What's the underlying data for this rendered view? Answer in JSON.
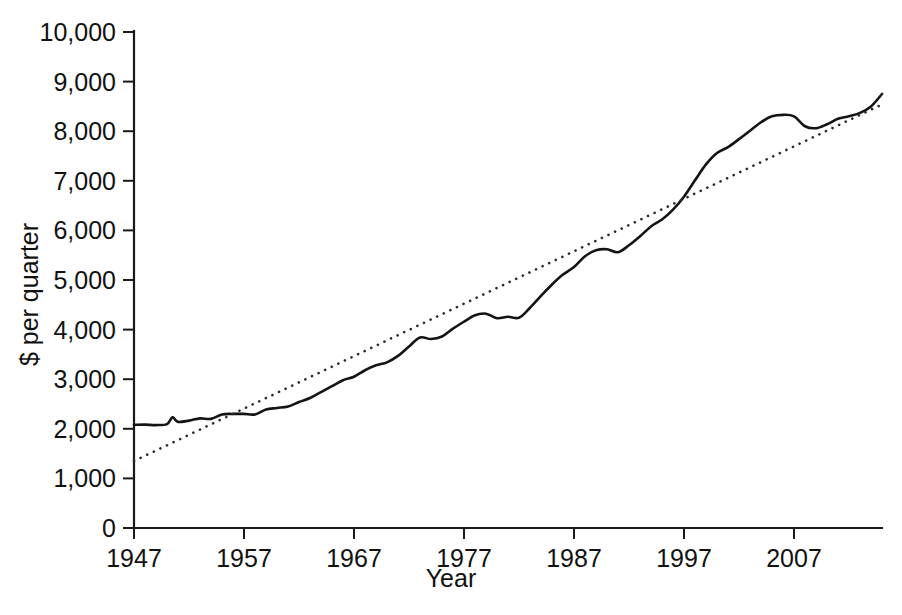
{
  "chart_data": {
    "type": "line",
    "title": "",
    "xlabel": "Year",
    "ylabel": "$ per quarter",
    "xlim": [
      1947,
      2015
    ],
    "ylim": [
      0,
      10000
    ],
    "grid": false,
    "legend": "none",
    "x_ticks": [
      "1947",
      "1957",
      "1967",
      "1977",
      "1987",
      "1997",
      "2007"
    ],
    "x_tick_values": [
      1947,
      1957,
      1967,
      1977,
      1987,
      1997,
      2007
    ],
    "y_ticks": [
      "0",
      "1,000",
      "2,000",
      "3,000",
      "4,000",
      "5,000",
      "6,000",
      "7,000",
      "8,000",
      "9,000",
      "10,000"
    ],
    "y_tick_values": [
      0,
      1000,
      2000,
      3000,
      4000,
      5000,
      6000,
      7000,
      8000,
      9000,
      10000
    ],
    "series": [
      {
        "name": "Consumption per quarter",
        "style": "solid",
        "color": "#141414",
        "x": [
          1947,
          1948,
          1949,
          1950,
          1950.5,
          1951,
          1952,
          1953,
          1954,
          1955,
          1956,
          1957,
          1958,
          1959,
          1960,
          1961,
          1962,
          1963,
          1964,
          1965,
          1966,
          1967,
          1968,
          1969,
          1970,
          1971,
          1972,
          1973,
          1974,
          1975,
          1976,
          1977,
          1978,
          1979,
          1980,
          1981,
          1982,
          1983,
          1984,
          1985,
          1986,
          1987,
          1988,
          1989,
          1990,
          1991,
          1992,
          1993,
          1994,
          1995,
          1996,
          1997,
          1998,
          1999,
          2000,
          2001,
          2002,
          2003,
          2004,
          2005,
          2006,
          2007,
          2008,
          2009,
          2010,
          2011,
          2012,
          2013,
          2014,
          2015
        ],
        "y": [
          2080,
          2085,
          2075,
          2095,
          2230,
          2140,
          2165,
          2210,
          2200,
          2290,
          2300,
          2300,
          2290,
          2390,
          2420,
          2450,
          2540,
          2620,
          2740,
          2860,
          2980,
          3050,
          3180,
          3280,
          3340,
          3470,
          3660,
          3840,
          3810,
          3860,
          4020,
          4160,
          4290,
          4320,
          4230,
          4260,
          4240,
          4440,
          4680,
          4910,
          5110,
          5260,
          5480,
          5600,
          5620,
          5560,
          5700,
          5880,
          6080,
          6220,
          6420,
          6680,
          7010,
          7330,
          7560,
          7680,
          7840,
          8010,
          8180,
          8300,
          8330,
          8300,
          8100,
          8060,
          8140,
          8250,
          8300,
          8370,
          8500,
          8750
        ]
      },
      {
        "name": "Linear trend",
        "style": "dotted",
        "color": "#2b2b2b",
        "x": [
          1947,
          2015
        ],
        "y": [
          1350,
          8540
        ]
      }
    ]
  },
  "axis_titles": {
    "x": "Year",
    "y": "$ per quarter"
  }
}
